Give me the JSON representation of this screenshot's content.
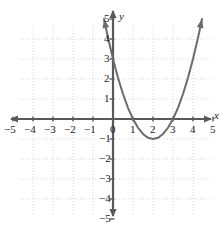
{
  "chart_data": {
    "type": "line",
    "title": "",
    "subtitle": "",
    "xlabel": "x",
    "ylabel": "y",
    "xlim": [
      -5.6,
      5.6
    ],
    "ylim": [
      -5.6,
      5.6
    ],
    "grid": true,
    "legend": false,
    "equation": "y = (x - 2)^2 - 1",
    "vertex": [
      2,
      -1
    ],
    "x_intercepts": [
      1,
      3
    ],
    "y_intercept": 3,
    "x_ticks": [
      -5,
      -4,
      -3,
      -2,
      -1,
      0,
      1,
      2,
      3,
      4,
      5
    ],
    "y_ticks": [
      -5,
      -4,
      -3,
      -2,
      -1,
      1,
      2,
      3,
      4,
      5
    ],
    "x_tick_labels": [
      "-5",
      "-4",
      "-3",
      "-2",
      "-1",
      "0",
      "1",
      "2",
      "3",
      "4",
      "5"
    ],
    "y_tick_labels": [
      "-5",
      "-4",
      "-3",
      "-2",
      "-1",
      "1",
      "2",
      "3",
      "4",
      "5"
    ],
    "series": [
      {
        "name": "parabola",
        "color": "#6b6b6b",
        "arrow_start": true,
        "arrow_end": true,
        "x": [
          -0.45,
          -0.25,
          0.0,
          0.25,
          0.5,
          0.75,
          1.0,
          1.25,
          1.5,
          1.75,
          2.0,
          2.25,
          2.5,
          2.75,
          3.0,
          3.25,
          3.5,
          3.75,
          4.0,
          4.25,
          4.45
        ],
        "y": [
          5.0,
          4.06,
          3.0,
          2.06,
          1.25,
          0.56,
          0.0,
          -0.44,
          -0.75,
          -0.94,
          -1.0,
          -0.94,
          -0.75,
          -0.44,
          0.0,
          0.56,
          1.25,
          2.06,
          3.0,
          4.06,
          5.0
        ]
      }
    ],
    "colors": {
      "curve": "#6b6b6b",
      "axis": "#595959",
      "grid": "#d8d8d8",
      "text": "#1a1a1a",
      "background": "#ffffff"
    }
  },
  "axis_labels": {
    "x": "x",
    "y": "y"
  },
  "origin_label": "0"
}
